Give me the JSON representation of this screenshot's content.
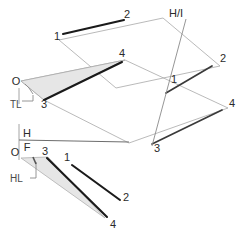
{
  "drawing": {
    "title": "Descriptive geometry: horizontal and frontal views of lines 1-2 and 3-4",
    "colors": {
      "heavy_line": "#1a1a1a",
      "light_line": "#9a9a9a",
      "fold_line": "#808080",
      "shade_fill": "#e6e6e6",
      "shade_stroke": "#a8a8a8",
      "label_text": "#2b2b2b",
      "leader": "#8a8a8a"
    },
    "views": {
      "upper": {
        "name": "horizontal-view",
        "labels": {
          "origin": "O",
          "point_1_left": "1",
          "point_2_top": "2",
          "point_4": "4",
          "point_3_near_origin": "3",
          "point_1_right": "1",
          "point_2_right": "2",
          "point_4_right": "4",
          "point_3_right": "3",
          "true_length": "TL"
        }
      },
      "fold_hf": {
        "name": "fold-line-h-f",
        "upper_label": "H",
        "lower_label": "F"
      },
      "fold_hi": {
        "name": "fold-line-h-i",
        "label": "H/I"
      },
      "lower": {
        "name": "frontal-view",
        "labels": {
          "origin": "O",
          "point_3": "3",
          "point_1": "1",
          "point_2": "2",
          "point_4": "4",
          "horizontal_line": "HL"
        }
      }
    }
  }
}
